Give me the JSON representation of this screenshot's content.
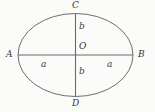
{
  "figure": {
    "type": "geometry-diagram",
    "shape": "ellipse",
    "background_color": "#fbfbfa",
    "stroke_color": "#595959",
    "text_color": "#343434",
    "geometry": {
      "center_x": 75.5,
      "center_y": 55,
      "semi_major_axis_px": 57.5,
      "semi_minor_axis_px": 41.5,
      "major_axis_endpoints": [
        "A",
        "B"
      ],
      "minor_axis_endpoints": [
        "C",
        "D"
      ]
    },
    "labels": {
      "vertex_left": "A",
      "vertex_right": "B",
      "vertex_top": "C",
      "vertex_bottom": "D",
      "center": "O",
      "semi_major_left": "a",
      "semi_major_right": "a",
      "semi_minor_top": "b",
      "semi_minor_bottom": "b"
    }
  }
}
